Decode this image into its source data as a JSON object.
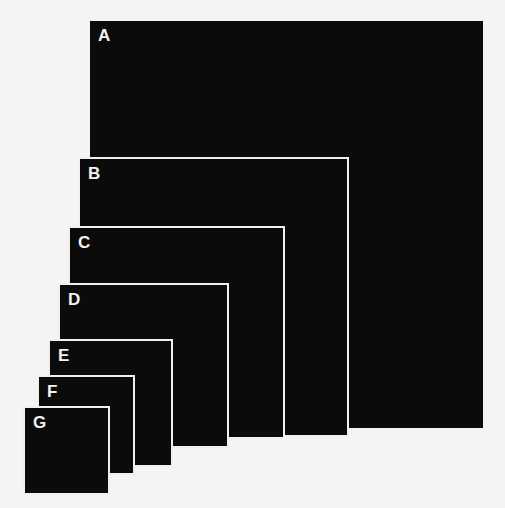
{
  "diagram": {
    "title": "",
    "squares": [
      {
        "label": "A",
        "x": 90,
        "y": 21,
        "w": 393,
        "h": 407
      },
      {
        "label": "B",
        "x": 80,
        "y": 159,
        "w": 267,
        "h": 276
      },
      {
        "label": "C",
        "x": 70,
        "y": 228,
        "w": 213,
        "h": 209
      },
      {
        "label": "D",
        "x": 60,
        "y": 285,
        "w": 167,
        "h": 161
      },
      {
        "label": "E",
        "x": 50,
        "y": 341,
        "w": 121,
        "h": 124
      },
      {
        "label": "F",
        "x": 39,
        "y": 377,
        "w": 94,
        "h": 96
      },
      {
        "label": "G",
        "x": 25,
        "y": 408,
        "w": 83,
        "h": 85
      }
    ],
    "colors": {
      "square_fill": "#0b0b0b",
      "outline": "#f0f0ee",
      "background": "#f4f4f2",
      "label": "#f2f2f2"
    }
  }
}
